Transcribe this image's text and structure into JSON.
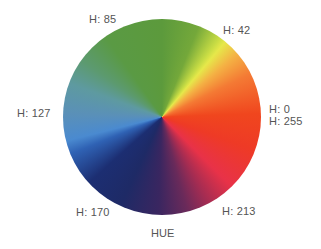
{
  "diagram": {
    "type": "hue-color-wheel",
    "caption": "HUE",
    "labels": [
      {
        "text": "H: 85",
        "value": 85,
        "position": "top-left"
      },
      {
        "text": "H: 42",
        "value": 42,
        "position": "top-right"
      },
      {
        "text": "H: 127",
        "value": 127,
        "position": "left"
      },
      {
        "text": "H: 0",
        "value": 0,
        "position": "right"
      },
      {
        "text": "H: 255",
        "value": 255,
        "position": "right"
      },
      {
        "text": "H: 170",
        "value": 170,
        "position": "bottom-left"
      },
      {
        "text": "H: 213",
        "value": 213,
        "position": "bottom-right"
      }
    ],
    "colors": {
      "green": "#5c9a3c",
      "yellow": "#e6e84a",
      "orange": "#f47a34",
      "red": "#f0461e",
      "crimson": "#e83248",
      "purple": "#6a2a5a",
      "navy": "#1e2a66",
      "blue": "#4a8ad0",
      "steel_blue": "#5a90b8",
      "teal": "#5c9a70",
      "label_text": "#555555",
      "background": "#ffffff"
    }
  }
}
